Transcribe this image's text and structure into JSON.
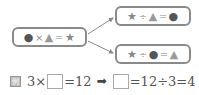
{
  "diagram": {
    "source_equation": {
      "parts": [
        "●",
        "×",
        "▲",
        "=",
        "★"
      ]
    },
    "derived_top": {
      "parts": [
        "★",
        "÷",
        "▲",
        "=",
        "●"
      ]
    },
    "derived_bottom": {
      "parts": [
        "★",
        "÷",
        "●",
        "=",
        "▲"
      ]
    },
    "arrow_color": "#8a8a8a",
    "border_color": "#8a8a8a"
  },
  "example": {
    "label": "例",
    "left": {
      "a": "3",
      "op": "×",
      "eq": "=",
      "result": "12"
    },
    "arrow": "➡",
    "right": {
      "eq": "=",
      "expr": "12÷3",
      "eq2": "=",
      "answer": "4"
    }
  }
}
